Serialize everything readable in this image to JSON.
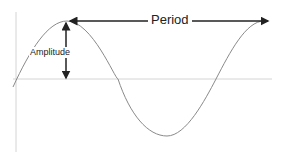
{
  "diagram": {
    "labels": {
      "amplitude": "Amplitude",
      "period": "Period"
    },
    "colors": {
      "axis": "#d0d0d0",
      "curve": "#8a8a8a",
      "arrow": "#222222"
    }
  }
}
